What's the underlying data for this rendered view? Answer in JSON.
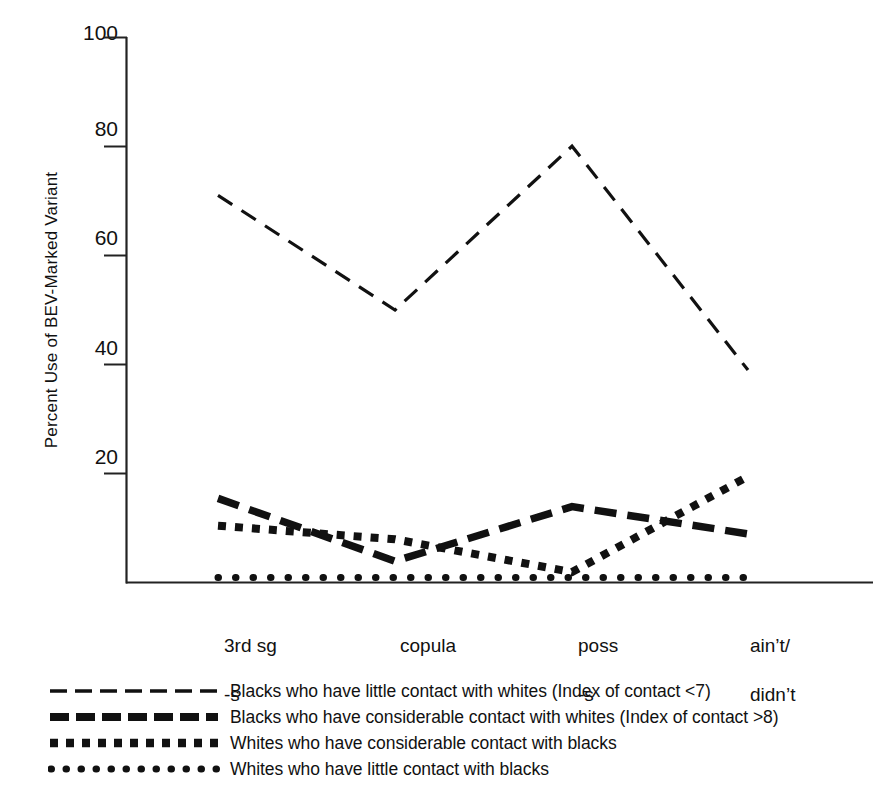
{
  "chart_data": {
    "type": "line",
    "title": "",
    "xlabel": "",
    "ylabel": "Percent Use of BEV-Marked Variant",
    "categories": [
      "3rd sg\n-s",
      "copula",
      "poss\n-s",
      "ain't/\ndidn't"
    ],
    "x_tick_labels": [
      "3rd sg\n-s",
      "copula",
      "poss\n-s",
      "ain't/\ndidn't"
    ],
    "y_tick_labels": [
      "20",
      "40",
      "60",
      "80",
      "100"
    ],
    "y_ticks": [
      20,
      40,
      60,
      80,
      100
    ],
    "ylim": [
      0,
      100
    ],
    "grid": false,
    "legend_position": "below",
    "series": [
      {
        "name": "Blacks who have little contact with whites (Index of contact <7)",
        "style": "thin-dashed",
        "values": [
          71,
          50,
          80,
          39
        ]
      },
      {
        "name": "Blacks who have considerable contact with whites (Index of contact >8)",
        "style": "thick-dashed",
        "values": [
          15.5,
          4,
          14,
          9
        ]
      },
      {
        "name": "Whites who have considerable contact with blacks",
        "style": "thick-square-dotted",
        "values": [
          10.5,
          8,
          2,
          19.5
        ]
      },
      {
        "name": "Whites who have little contact with blacks",
        "style": "fine-dotted",
        "values": [
          1,
          1,
          1,
          1
        ]
      }
    ]
  },
  "axis": {
    "y_label": "Percent Use of BEV-Marked Variant",
    "tick_100": "100",
    "tick_80": "80",
    "tick_60": "60",
    "tick_40": "40",
    "tick_20": "20"
  },
  "x_labels": {
    "cat_0_line1": "3rd sg",
    "cat_0_line2": "-s",
    "cat_1_line1": "copula",
    "cat_1_line2": "",
    "cat_2_line1": "poss",
    "cat_2_line2": "-s",
    "cat_3_line1": "ain’t/",
    "cat_3_line2": "didn’t"
  },
  "legend": {
    "items": [
      {
        "label": "Blacks who have little contact with whites (Index of contact <7)",
        "swatch": "thin-dashed-line-swatch"
      },
      {
        "label": "Blacks who have considerable contact with whites (Index of contact >8)",
        "swatch": "thick-dashed-line-swatch"
      },
      {
        "label": "Whites who have considerable contact with blacks",
        "swatch": "thick-square-dotted-line-swatch"
      },
      {
        "label": "Whites who have little contact with blacks",
        "swatch": "fine-dotted-line-swatch"
      }
    ]
  },
  "colors": {
    "ink": "#111111",
    "background": "#ffffff"
  }
}
